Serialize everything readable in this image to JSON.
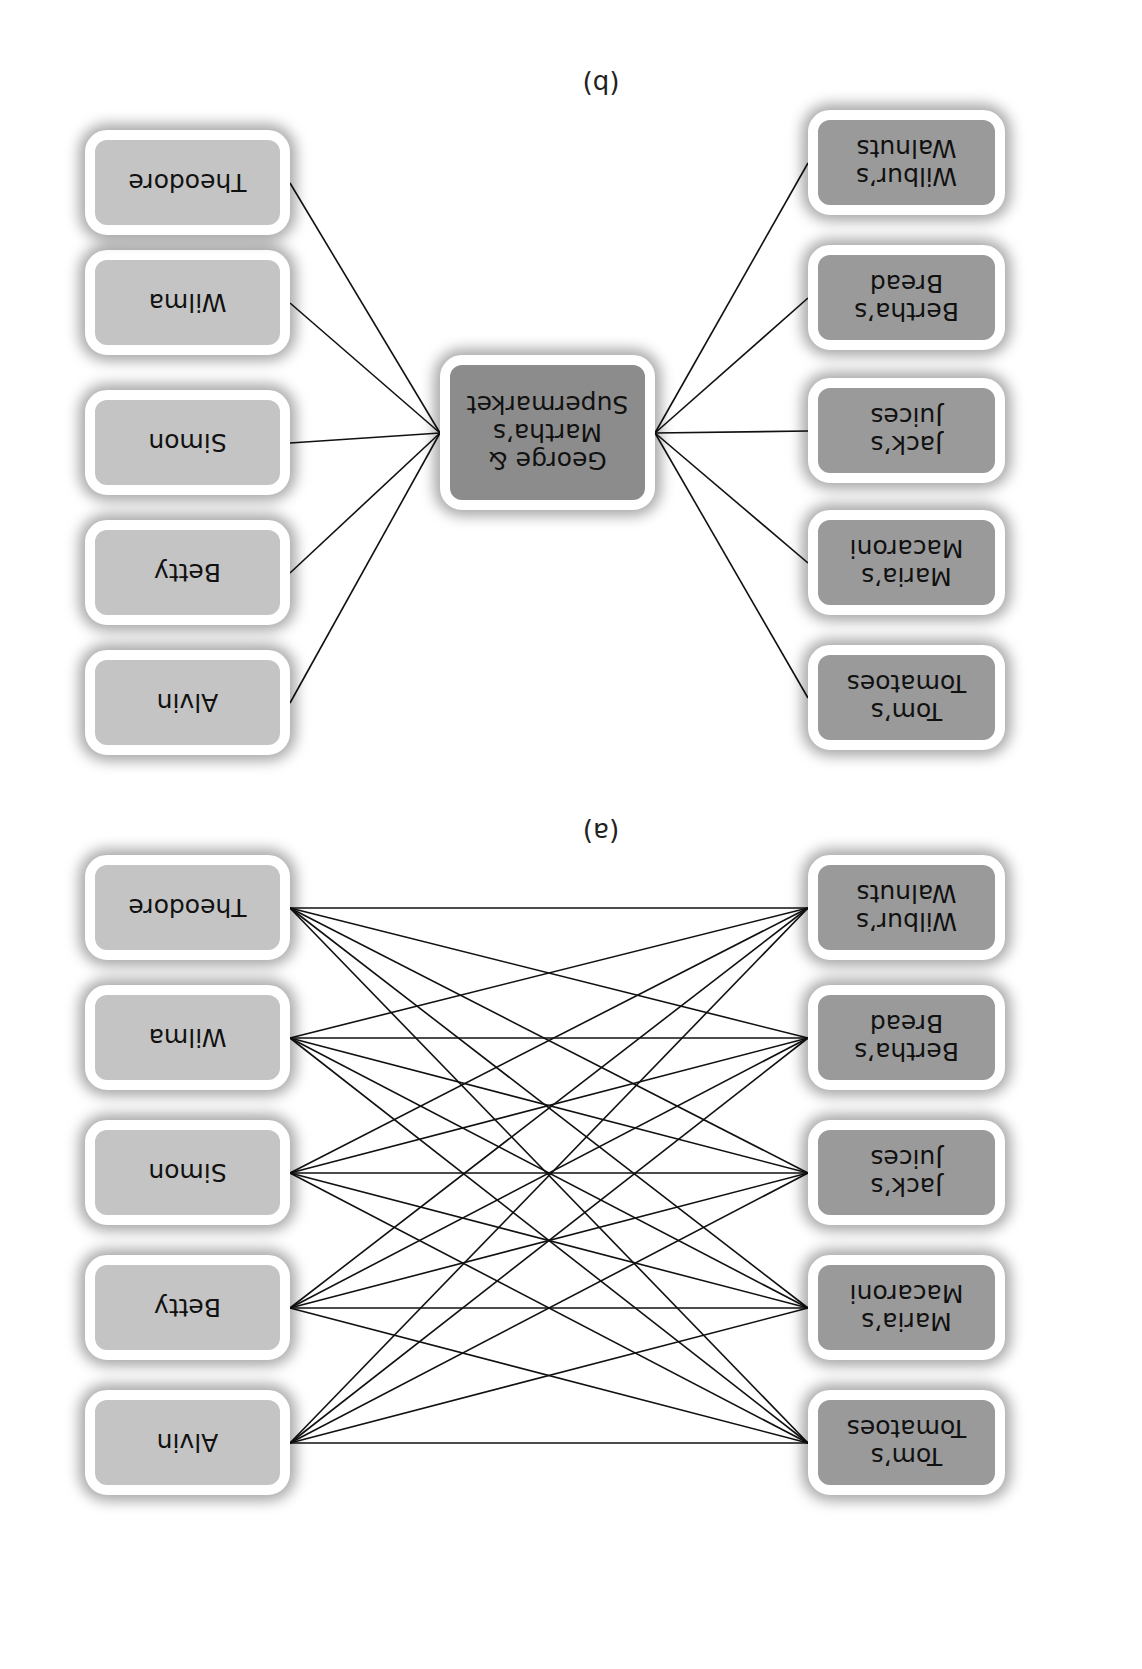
{
  "orientation": "rotated-180-degrees",
  "panels": [
    {
      "label": "(a)",
      "description": "Direct connections: every customer connected to every supplier",
      "suppliers": [
        "Tom’s\nTomatoes",
        "Maria’s\nMacaroni",
        "Jack’s\nJuices",
        "Bertha’s\nBread",
        "Wilbur’s\nWalnuts"
      ],
      "customers": [
        "Alvin",
        "Betty",
        "Simon",
        "Wilma",
        "Theodore"
      ]
    },
    {
      "label": "(b)",
      "description": "Connections through an intermediary supermarket",
      "suppliers": [
        "Tom’s\nTomatoes",
        "Maria’s\nMacaroni",
        "Jack’s\nJuices",
        "Bertha’s\nBread",
        "Wilbur’s\nWalnuts"
      ],
      "center": "George &\nMartha’s\nSupermarket",
      "customers": [
        "Alvin",
        "Betty",
        "Simon",
        "Wilma",
        "Theodore"
      ]
    }
  ],
  "colors": {
    "customer_fill": "#c4c4c4",
    "supplier_fill": "#9a9a9a",
    "center_fill": "#8c8c8c",
    "border": "#ffffff",
    "line": "#111111"
  }
}
